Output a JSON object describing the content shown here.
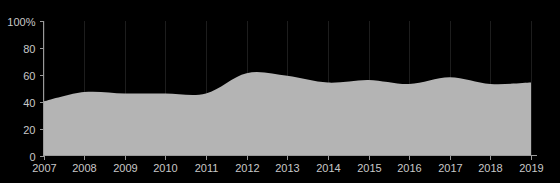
{
  "chart_data": {
    "type": "area",
    "title": "",
    "xlabel": "",
    "ylabel": "",
    "x": [
      2007,
      2008,
      2009,
      2010,
      2011,
      2012,
      2013,
      2014,
      2015,
      2016,
      2017,
      2018,
      2019
    ],
    "values": [
      40,
      47,
      46,
      46,
      46,
      61,
      59,
      54,
      56,
      53,
      58,
      53,
      54
    ],
    "series": [
      {
        "name": "share",
        "values": [
          40,
          47,
          46,
          46,
          46,
          61,
          59,
          54,
          56,
          53,
          58,
          53,
          54
        ]
      }
    ],
    "categories": [
      "2007",
      "2008",
      "2009",
      "2010",
      "2011",
      "2012",
      "2013",
      "2014",
      "2015",
      "2016",
      "2017",
      "2018",
      "2019"
    ],
    "xtick_labels": [
      "2007",
      "2008",
      "2009",
      "2010",
      "2011",
      "2012",
      "2013",
      "2014",
      "2015",
      "2016",
      "2017",
      "2018",
      "2019"
    ],
    "ytick_values": [
      0,
      20,
      40,
      60,
      80,
      100
    ],
    "ytick_labels": [
      "0",
      "20",
      "40",
      "60",
      "80",
      "100%"
    ],
    "ylim": [
      0,
      100
    ],
    "xlim": [
      2007,
      2019
    ],
    "grid": true,
    "grid_axis": "x",
    "legend": false,
    "legend_position": "none",
    "colors": {
      "background": "#000000",
      "area_fill": "#b4b4b4",
      "axis": "#9a9a9a",
      "tick_text": "#c8c8c8",
      "gridline": "#1d1d1d"
    }
  }
}
